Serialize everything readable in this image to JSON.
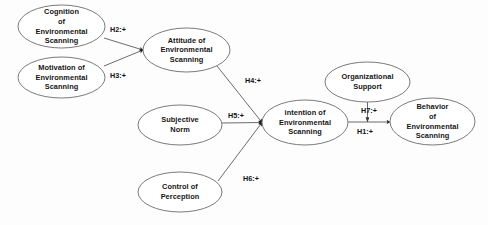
{
  "diagram": {
    "type": "path-model",
    "background_color": "#fdfdfd",
    "node_fill": "#ffffff",
    "node_stroke": "#6b6b6b",
    "edge_color": "#5a5a5a",
    "nodes": [
      {
        "id": "cognition",
        "label": "Cognition\nof\nEnvironmental\nScanning",
        "cx": 61.5,
        "cy": 26.5,
        "rx": 43.5,
        "ry": 21.5
      },
      {
        "id": "motivation",
        "label": "Motivation of\nEnvironmental\nScanning",
        "cx": 61.5,
        "cy": 77.5,
        "rx": 43.5,
        "ry": 20.5
      },
      {
        "id": "attitude",
        "label": "Attitude of\nEnvironmental\nScanning",
        "cx": 186.5,
        "cy": 50.0,
        "rx": 43.5,
        "ry": 22.0
      },
      {
        "id": "subjective-norm",
        "label": "Subjective\nNorm",
        "cx": 180.0,
        "cy": 125.0,
        "rx": 42.0,
        "ry": 20.0
      },
      {
        "id": "control-of-perception",
        "label": "Control of\nPerception",
        "cx": 180.0,
        "cy": 192.0,
        "rx": 42.0,
        "ry": 20.0
      },
      {
        "id": "intention",
        "label": "intention of\nEnvironmental\nScanning",
        "cx": 305.0,
        "cy": 122.5,
        "rx": 43.0,
        "ry": 22.5
      },
      {
        "id": "organizational-support",
        "label": "Organizational\nSupport",
        "cx": 367.5,
        "cy": 82.0,
        "rx": 42.5,
        "ry": 20.0
      },
      {
        "id": "behavior",
        "label": "Behavior\nof\nEnvironmental\nScanning",
        "cx": 432.5,
        "cy": 121.5,
        "rx": 42.5,
        "ry": 23.5
      }
    ],
    "edges": [
      {
        "id": "h2",
        "label": "H2:+",
        "from": "cognition",
        "to": "attitude",
        "x1": 104.0,
        "y1": 38.0,
        "x2": 143.0,
        "y2": 50.0,
        "label_x": 110.0,
        "label_y": 25.0
      },
      {
        "id": "h3",
        "label": "H3:+",
        "from": "motivation",
        "to": "attitude",
        "x1": 104.0,
        "y1": 66.0,
        "x2": 143.0,
        "y2": 50.0,
        "label_x": 110.0,
        "label_y": 70.5
      },
      {
        "id": "h4",
        "label": "H4:+",
        "from": "attitude",
        "to": "intention",
        "x1": 217.0,
        "y1": 66.0,
        "x2": 262.0,
        "y2": 122.5,
        "label_x": 245.0,
        "label_y": 76.0
      },
      {
        "id": "h5",
        "label": "H5:+",
        "from": "subjective-norm",
        "to": "intention",
        "x1": 222.0,
        "y1": 123.0,
        "x2": 262.0,
        "y2": 122.5,
        "label_x": 228.0,
        "label_y": 111.0
      },
      {
        "id": "h6",
        "label": "H6:+",
        "from": "control-of-perception",
        "to": "intention",
        "x1": 218.0,
        "y1": 181.0,
        "x2": 262.0,
        "y2": 122.5,
        "label_x": 243.0,
        "label_y": 174.0
      },
      {
        "id": "h7",
        "label": "H7:+",
        "from": "organizational-support",
        "to": "h1-midpoint",
        "x1": 367.5,
        "y1": 102.0,
        "x2": 367.5,
        "y2": 122.0,
        "label_x": 361.0,
        "label_y": 106.0
      },
      {
        "id": "h1",
        "label": "H1:+",
        "from": "intention",
        "to": "behavior",
        "x1": 348.0,
        "y1": 122.0,
        "x2": 390.0,
        "y2": 122.0,
        "label_x": 357.0,
        "label_y": 127.0
      }
    ]
  }
}
